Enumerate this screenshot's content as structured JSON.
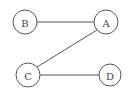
{
  "graph": {
    "nodes": [
      {
        "id": "A",
        "label": "A",
        "x": 106,
        "y": 22,
        "r": 12
      },
      {
        "id": "B",
        "label": "B",
        "x": 25,
        "y": 22,
        "r": 12
      },
      {
        "id": "C",
        "label": "C",
        "x": 28,
        "y": 75,
        "r": 12
      },
      {
        "id": "D",
        "label": "D",
        "x": 110,
        "y": 75,
        "r": 11
      }
    ],
    "edges": [
      {
        "from": "B",
        "to": "A"
      },
      {
        "from": "A",
        "to": "C"
      },
      {
        "from": "C",
        "to": "D"
      }
    ],
    "colors": {
      "stroke": "#555555",
      "text": "#444444",
      "background": "#ffffff"
    }
  }
}
